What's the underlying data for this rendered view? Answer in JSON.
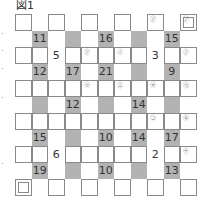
{
  "figure": {
    "title": "図1"
  },
  "grid": {
    "rows": 11,
    "cols": 11,
    "cells": [
      {
        "r": 0,
        "c": 0,
        "type": "box"
      },
      {
        "r": 0,
        "c": 2,
        "type": "box"
      },
      {
        "r": 0,
        "c": 4,
        "type": "box"
      },
      {
        "r": 0,
        "c": 6,
        "type": "box"
      },
      {
        "r": 0,
        "c": 8,
        "type": "box",
        "mark": "㋐"
      },
      {
        "r": 0,
        "c": 10,
        "type": "double",
        "mark": "㋐"
      },
      {
        "r": 1,
        "c": 1,
        "type": "gray",
        "value": "11"
      },
      {
        "r": 1,
        "c": 3,
        "type": "gray"
      },
      {
        "r": 1,
        "c": 5,
        "type": "gray",
        "value": "16"
      },
      {
        "r": 1,
        "c": 7,
        "type": "gray"
      },
      {
        "r": 1,
        "c": 9,
        "type": "gray",
        "value": "15"
      },
      {
        "r": 2,
        "c": 0,
        "type": "box"
      },
      {
        "r": 2,
        "c": 1,
        "type": "box"
      },
      {
        "r": 2,
        "c": 2,
        "type": "plain",
        "value": "5"
      },
      {
        "r": 2,
        "c": 3,
        "type": "box"
      },
      {
        "r": 2,
        "c": 4,
        "type": "box",
        "mark": "㋐"
      },
      {
        "r": 2,
        "c": 5,
        "type": "box"
      },
      {
        "r": 2,
        "c": 6,
        "type": "box",
        "mark": "㋑"
      },
      {
        "r": 2,
        "c": 7,
        "type": "box"
      },
      {
        "r": 2,
        "c": 8,
        "type": "plain",
        "value": "3"
      },
      {
        "r": 2,
        "c": 9,
        "type": "box"
      },
      {
        "r": 2,
        "c": 10,
        "type": "box",
        "mark": "㋐"
      },
      {
        "r": 3,
        "c": 1,
        "type": "gray",
        "value": "12"
      },
      {
        "r": 3,
        "c": 3,
        "type": "gray",
        "value": "17"
      },
      {
        "r": 3,
        "c": 5,
        "type": "gray",
        "value": "21"
      },
      {
        "r": 3,
        "c": 7,
        "type": "gray"
      },
      {
        "r": 3,
        "c": 9,
        "type": "gray",
        "value": "9"
      },
      {
        "r": 4,
        "c": 0,
        "type": "box"
      },
      {
        "r": 4,
        "c": 1,
        "type": "box"
      },
      {
        "r": 4,
        "c": 2,
        "type": "box"
      },
      {
        "r": 4,
        "c": 3,
        "type": "box"
      },
      {
        "r": 4,
        "c": 4,
        "type": "box",
        "mark": "㋒"
      },
      {
        "r": 4,
        "c": 5,
        "type": "box"
      },
      {
        "r": 4,
        "c": 6,
        "type": "box",
        "mark": "㋓"
      },
      {
        "r": 4,
        "c": 7,
        "type": "box"
      },
      {
        "r": 4,
        "c": 8,
        "type": "box",
        "mark": "㋔"
      },
      {
        "r": 4,
        "c": 9,
        "type": "box"
      },
      {
        "r": 4,
        "c": 10,
        "type": "box",
        "mark": "㋕"
      },
      {
        "r": 5,
        "c": 1,
        "type": "gray"
      },
      {
        "r": 5,
        "c": 3,
        "type": "gray",
        "value": "12"
      },
      {
        "r": 5,
        "c": 5,
        "type": "gray"
      },
      {
        "r": 5,
        "c": 7,
        "type": "gray",
        "value": "14"
      },
      {
        "r": 5,
        "c": 9,
        "type": "gray"
      },
      {
        "r": 6,
        "c": 0,
        "type": "box"
      },
      {
        "r": 6,
        "c": 1,
        "type": "box"
      },
      {
        "r": 6,
        "c": 2,
        "type": "box"
      },
      {
        "r": 6,
        "c": 3,
        "type": "box"
      },
      {
        "r": 6,
        "c": 4,
        "type": "box"
      },
      {
        "r": 6,
        "c": 5,
        "type": "box"
      },
      {
        "r": 6,
        "c": 6,
        "type": "box"
      },
      {
        "r": 6,
        "c": 7,
        "type": "box"
      },
      {
        "r": 6,
        "c": 8,
        "type": "box",
        "mark": "㋙"
      },
      {
        "r": 6,
        "c": 9,
        "type": "box"
      },
      {
        "r": 6,
        "c": 10,
        "type": "box",
        "mark": "㋖"
      },
      {
        "r": 7,
        "c": 1,
        "type": "gray",
        "value": "15"
      },
      {
        "r": 7,
        "c": 3,
        "type": "gray"
      },
      {
        "r": 7,
        "c": 5,
        "type": "gray",
        "value": "10"
      },
      {
        "r": 7,
        "c": 7,
        "type": "gray",
        "value": "14"
      },
      {
        "r": 7,
        "c": 9,
        "type": "gray",
        "value": "17"
      },
      {
        "r": 8,
        "c": 0,
        "type": "box"
      },
      {
        "r": 8,
        "c": 1,
        "type": "box"
      },
      {
        "r": 8,
        "c": 2,
        "type": "plain",
        "value": "6"
      },
      {
        "r": 8,
        "c": 3,
        "type": "box"
      },
      {
        "r": 8,
        "c": 4,
        "type": "box"
      },
      {
        "r": 8,
        "c": 5,
        "type": "box"
      },
      {
        "r": 8,
        "c": 6,
        "type": "box"
      },
      {
        "r": 8,
        "c": 7,
        "type": "box"
      },
      {
        "r": 8,
        "c": 8,
        "type": "plain",
        "value": "2"
      },
      {
        "r": 8,
        "c": 9,
        "type": "box"
      },
      {
        "r": 8,
        "c": 10,
        "type": "box",
        "mark": "㋘"
      },
      {
        "r": 9,
        "c": 1,
        "type": "gray",
        "value": "19"
      },
      {
        "r": 9,
        "c": 3,
        "type": "gray"
      },
      {
        "r": 9,
        "c": 5,
        "type": "gray",
        "value": "10"
      },
      {
        "r": 9,
        "c": 7,
        "type": "gray"
      },
      {
        "r": 9,
        "c": 9,
        "type": "gray",
        "value": "13"
      },
      {
        "r": 10,
        "c": 0,
        "type": "double"
      },
      {
        "r": 10,
        "c": 2,
        "type": "box"
      },
      {
        "r": 10,
        "c": 4,
        "type": "box"
      },
      {
        "r": 10,
        "c": 6,
        "type": "box"
      },
      {
        "r": 10,
        "c": 8,
        "type": "box"
      },
      {
        "r": 10,
        "c": 10,
        "type": "box"
      }
    ]
  },
  "colors": {
    "clue_gray": "#b3b3b3",
    "border": "#8a8a8a",
    "text": "#333333"
  }
}
